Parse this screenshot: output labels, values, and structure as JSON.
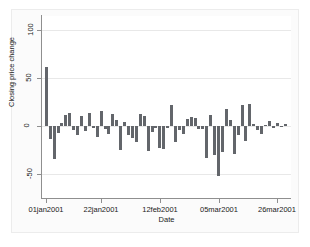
{
  "chart_data": {
    "type": "bar",
    "title": "",
    "subtitle": "",
    "xlabel": "Date",
    "ylabel": "Closing price change",
    "grid": true,
    "legend": false,
    "legend_position": "none",
    "bar_color": "#63666b",
    "plot_background": "#ffffff",
    "figure_background": "#fbfbfb",
    "axis_color": "#8f8f8f",
    "gridline_color": "#e8e8e8",
    "ylim": [
      -75,
      115
    ],
    "yticks": [
      -50,
      0,
      50,
      100
    ],
    "ytick_labels": [
      "-50",
      "0",
      "50",
      "100"
    ],
    "xtick_labels": [
      "01jan2001",
      "22jan2001",
      "12feb2001",
      "05mar2001",
      "26mar2001"
    ],
    "xtick_values": [
      "01jan2001",
      "22jan2001",
      "12feb2001",
      "05mar2001",
      "26mar2001"
    ],
    "xlim": [
      "29dec2000",
      "30mar2001"
    ],
    "categories": [
      "02jan2001",
      "03jan2001",
      "04jan2001",
      "05jan2001",
      "08jan2001",
      "09jan2001",
      "10jan2001",
      "11jan2001",
      "12jan2001",
      "15jan2001",
      "16jan2001",
      "17jan2001",
      "18jan2001",
      "19jan2001",
      "22jan2001",
      "23jan2001",
      "24jan2001",
      "25jan2001",
      "26jan2001",
      "29jan2001",
      "30jan2001",
      "31jan2001",
      "01feb2001",
      "02feb2001",
      "05feb2001",
      "06feb2001",
      "07feb2001",
      "08feb2001",
      "09feb2001",
      "12feb2001",
      "13feb2001",
      "14feb2001",
      "15feb2001",
      "16feb2001",
      "19feb2001",
      "20feb2001",
      "21feb2001",
      "22feb2001",
      "23feb2001",
      "26feb2001",
      "27feb2001",
      "28feb2001",
      "01mar2001",
      "02mar2001",
      "05mar2001",
      "06mar2001",
      "07mar2001",
      "08mar2001",
      "09mar2001",
      "12mar2001",
      "13mar2001",
      "14mar2001",
      "15mar2001",
      "16mar2001",
      "19mar2001",
      "20mar2001",
      "21mar2001",
      "22mar2001",
      "23mar2001",
      "26mar2001",
      "27mar2001",
      "28mar2001"
    ],
    "values": [
      62,
      -13,
      -34,
      -7,
      3,
      12,
      14,
      -4,
      -9,
      11,
      -5,
      14,
      -2,
      -11,
      16,
      -3,
      -8,
      13,
      6,
      -25,
      4,
      -9,
      -12,
      -17,
      13,
      11,
      -26,
      -6,
      -2,
      -23,
      -24,
      -2,
      22,
      -17,
      -4,
      -8,
      7,
      10,
      9,
      -3,
      -3,
      -33,
      12,
      -30,
      -52,
      -27,
      18,
      6,
      -29,
      -9,
      22,
      -16,
      23,
      2,
      -4,
      -8,
      1,
      5,
      -2,
      3,
      -1,
      2
    ],
    "series_name": "Closing price change"
  },
  "axis": {
    "y_title": "Closing price change",
    "x_title": "Date"
  }
}
